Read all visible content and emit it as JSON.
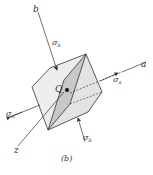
{
  "figure": {
    "caption": "(b)",
    "axes": {
      "a_label": "a",
      "b_label": "b",
      "z_label": "z"
    },
    "point_label": "Q",
    "stresses": {
      "sigma_b_top": "σ",
      "sigma_b_top_sub": "b",
      "sigma_b_bottom": "σ",
      "sigma_b_bottom_sub": "b",
      "sigma_a_right": "σ",
      "sigma_a_right_sub": "a",
      "sigma_a_left": "σ",
      "sigma_a_left_sub": "a"
    },
    "colors": {
      "line": "#333333",
      "face_light": "#ececec",
      "face_mid": "#e2e2e2",
      "plane_shade": "#c8c8c8"
    }
  }
}
